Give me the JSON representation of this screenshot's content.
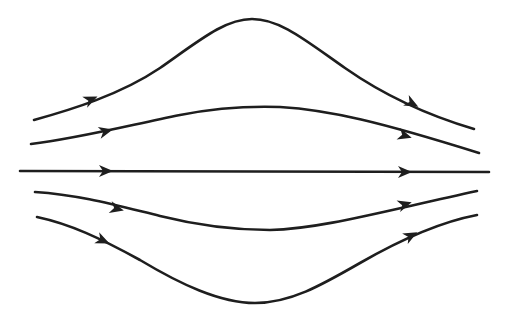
{
  "diagram": {
    "type": "streamlines",
    "stroke_color": "#1e1e1e",
    "background": "#ffffff",
    "flow_direction": "left-to-right",
    "streamlines": [
      {
        "id": "top-outer",
        "path": "M34,120 C70,110 120,95 160,68 C200,40 225,19 252,19 C280,19 305,40 345,68 C385,96 430,116 474,129",
        "arrows": [
          {
            "x": 92,
            "y": 99,
            "angle": -24
          },
          {
            "x": 413,
            "y": 104,
            "angle": 28
          }
        ]
      },
      {
        "id": "top-inner",
        "path": "M31,144 C80,138 130,125 180,115 C215,108 250,106 280,107 C330,110 380,122 479,153",
        "arrows": [
          {
            "x": 107,
            "y": 131,
            "angle": -14
          },
          {
            "x": 406,
            "y": 136,
            "angle": 17
          }
        ]
      },
      {
        "id": "center",
        "path": "M20,171 L489,172",
        "arrows": [
          {
            "x": 107,
            "y": 171,
            "angle": 0
          },
          {
            "x": 406,
            "y": 172,
            "angle": 0
          }
        ]
      },
      {
        "id": "bottom-inner",
        "path": "M35,192 C80,195 115,205 160,216 C200,226 240,230 270,230 C320,229 380,212 477,191",
        "arrows": [
          {
            "x": 118,
            "y": 209,
            "angle": 14
          },
          {
            "x": 406,
            "y": 204,
            "angle": -17
          }
        ]
      },
      {
        "id": "bottom-outer",
        "path": "M37,217 C70,224 100,238 140,260 C180,284 220,303 255,303 C290,303 320,286 360,263 C400,240 440,222 477,215",
        "arrows": [
          {
            "x": 104,
            "y": 241,
            "angle": 24
          },
          {
            "x": 412,
            "y": 235,
            "angle": -28
          }
        ]
      }
    ]
  }
}
